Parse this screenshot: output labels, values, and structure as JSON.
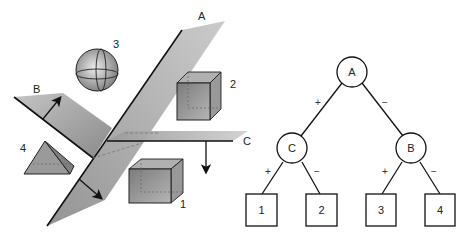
{
  "scene": {
    "planes": [
      {
        "id": "A",
        "label": "A"
      },
      {
        "id": "B",
        "label": "B"
      },
      {
        "id": "C",
        "label": "C"
      }
    ],
    "objects": [
      {
        "id": "1",
        "label": "1",
        "shape": "cube"
      },
      {
        "id": "2",
        "label": "2",
        "shape": "cube"
      },
      {
        "id": "3",
        "label": "3",
        "shape": "sphere"
      },
      {
        "id": "4",
        "label": "4",
        "shape": "pyramid"
      }
    ]
  },
  "tree": {
    "root": {
      "label": "A"
    },
    "internal": [
      {
        "label": "C",
        "parent": "A",
        "edge": "+"
      },
      {
        "label": "B",
        "parent": "A",
        "edge": "−"
      }
    ],
    "leaves": [
      {
        "label": "1",
        "parent": "C",
        "edge": "+"
      },
      {
        "label": "2",
        "parent": "C",
        "edge": "−"
      },
      {
        "label": "3",
        "parent": "B",
        "edge": "+"
      },
      {
        "label": "4",
        "parent": "B",
        "edge": "−"
      }
    ],
    "edge_labels": {
      "a_c": "+",
      "a_b": "−",
      "c_1": "+",
      "c_2": "−",
      "b_3": "+",
      "b_4": "−"
    }
  },
  "colors": {
    "plane": "#a9a9a9",
    "stroke": "#111111",
    "object": "#8c8c8c"
  }
}
